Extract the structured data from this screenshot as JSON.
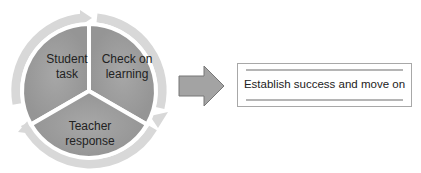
{
  "diagram": {
    "cycle": {
      "segments": [
        {
          "id": "student-task",
          "label_lines": [
            "Student",
            "task"
          ]
        },
        {
          "id": "check-on-learning",
          "label_lines": [
            "Check on",
            "learning"
          ]
        },
        {
          "id": "teacher-response",
          "label_lines": [
            "Teacher",
            "response"
          ]
        }
      ],
      "fill_color": "#9e9e9e",
      "ring_color": "#d6d6d6",
      "direction": "clockwise"
    },
    "arrow": {
      "icon": "right-arrow-icon",
      "fill_color": "#a3a3a3"
    },
    "result": {
      "label": "Establish success and move on",
      "bar_color": "#b5b5b5"
    }
  }
}
